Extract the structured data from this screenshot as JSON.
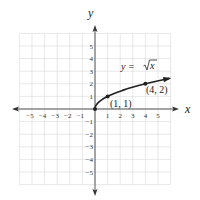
{
  "chart_data": {
    "type": "line",
    "title": "",
    "xlabel": "x",
    "ylabel": "y",
    "xlim": [
      -6,
      6
    ],
    "ylim": [
      -6,
      6
    ],
    "grid": true,
    "x_ticks": [
      -5,
      -4,
      -3,
      -2,
      -1,
      1,
      2,
      3,
      4,
      5
    ],
    "y_ticks": [
      -5,
      -4,
      -3,
      -2,
      -1,
      1,
      2,
      3,
      4,
      5
    ],
    "x_tick_labels": [
      "−5",
      "−4",
      "−3",
      "−2",
      "−1",
      "1",
      "2",
      "3",
      "4",
      "5"
    ],
    "y_tick_labels": [
      "−5",
      "−4",
      "−3",
      "−2",
      "−1",
      "1",
      "2",
      "3",
      "4",
      "5"
    ],
    "series": [
      {
        "name": "y = √x",
        "function": "sqrt(x)",
        "domain": [
          0,
          6
        ],
        "x": [
          0,
          0.25,
          0.5,
          1,
          2,
          3,
          4,
          5,
          6
        ],
        "y": [
          0,
          0.5,
          0.707,
          1,
          1.414,
          1.732,
          2,
          2.236,
          2.449
        ],
        "end_arrow": true
      }
    ],
    "points": [
      {
        "x": 0,
        "y": 0,
        "label": ""
      },
      {
        "x": 1,
        "y": 1,
        "label": "(1, 1)"
      },
      {
        "x": 4,
        "y": 2,
        "label": "(4, 2)"
      }
    ],
    "annotations": [
      {
        "text": "y = √x",
        "x": 3.1,
        "y": 3.4
      }
    ]
  },
  "labels": {
    "x_axis": "x",
    "y_axis": "y",
    "equation_prefix": "y = ",
    "equation_radicand": "x",
    "point_1": "(1, 1)",
    "point_2": "(4, 2)"
  },
  "colors": {
    "grid": "#d8d8d8",
    "axis": "#555555",
    "curve": "#222222"
  }
}
